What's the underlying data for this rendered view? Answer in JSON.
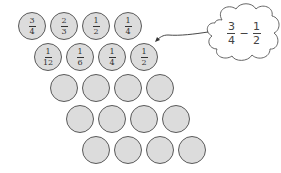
{
  "diagram": {
    "rows": [
      {
        "row": 1,
        "coins": [
          {
            "num": "3",
            "den": "4"
          },
          {
            "num": "2",
            "den": "3"
          },
          {
            "num": "1",
            "den": "2"
          },
          {
            "num": "1",
            "den": "4"
          }
        ]
      },
      {
        "row": 2,
        "coins": [
          {
            "num": "1",
            "den": "12"
          },
          {
            "num": "1",
            "den": "6"
          },
          {
            "num": "1",
            "den": "4"
          },
          {
            "num": "1",
            "den": "2"
          }
        ]
      },
      {
        "row": 3,
        "coins": [
          {},
          {},
          {},
          {}
        ]
      },
      {
        "row": 4,
        "coins": [
          {},
          {},
          {},
          {}
        ]
      },
      {
        "row": 5,
        "coins": [
          {},
          {},
          {},
          {}
        ]
      }
    ],
    "thought_cloud": {
      "left": {
        "num": "3",
        "den": "4"
      },
      "operator": "−",
      "right": {
        "num": "1",
        "den": "2"
      },
      "points_to": "row 2, coin 4 (1/2)"
    },
    "colors": {
      "coin_fill": "#dcdcdc",
      "coin_stroke": "#5a5a5a",
      "text": "#333333"
    }
  }
}
